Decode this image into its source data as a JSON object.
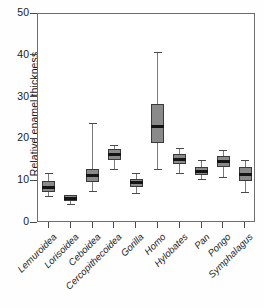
{
  "chart_data": {
    "type": "boxplot",
    "title": "",
    "xlabel": "",
    "ylabel": "Relative enamel thickness",
    "ylim": [
      0,
      50
    ],
    "yticks": [
      0,
      10,
      20,
      30,
      40,
      50
    ],
    "grid": false,
    "legend": "none",
    "categories": [
      "Lemuroidea",
      "Lorisoidea",
      "Ceboidea",
      "Cercopithecoidea",
      "Gorilla",
      "Homo",
      "Hylobates",
      "Pan",
      "Pongo",
      "Symphalagus"
    ],
    "boxes": [
      {
        "name": "Lemuroidea",
        "whisker_low": 6.5,
        "q1": 7.4,
        "median": 8.4,
        "q3": 10.0,
        "whisker_high": 12.0
      },
      {
        "name": "Lorisoidea",
        "whisker_low": 4.5,
        "q1": 5.2,
        "median": 5.9,
        "q3": 6.6,
        "whisker_high": 6.8
      },
      {
        "name": "Ceboidea",
        "whisker_low": 7.7,
        "q1": 9.8,
        "median": 11.3,
        "q3": 13.0,
        "whisker_high": 24.0
      },
      {
        "name": "Cercopithecoidea",
        "whisker_low": 13.0,
        "q1": 15.0,
        "median": 16.4,
        "q3": 17.8,
        "whisker_high": 18.6
      },
      {
        "name": "Gorilla",
        "whisker_low": 7.2,
        "q1": 8.6,
        "median": 9.6,
        "q3": 10.5,
        "whisker_high": 12.0
      },
      {
        "name": "Homo",
        "whisker_low": 13.0,
        "q1": 19.1,
        "median": 23.2,
        "q3": 28.5,
        "whisker_high": 41.0
      },
      {
        "name": "Hylobates",
        "whisker_low": 12.0,
        "q1": 14.0,
        "median": 15.2,
        "q3": 16.5,
        "whisker_high": 18.0
      },
      {
        "name": "Pan",
        "whisker_low": 10.5,
        "q1": 11.5,
        "median": 12.3,
        "q3": 13.5,
        "whisker_high": 15.0
      },
      {
        "name": "Pongo",
        "whisker_low": 11.0,
        "q1": 13.5,
        "median": 14.8,
        "q3": 16.0,
        "whisker_high": 17.5
      },
      {
        "name": "Symphalagus",
        "whisker_low": 7.5,
        "q1": 10.0,
        "median": 11.5,
        "q3": 13.5,
        "whisker_high": 15.0
      }
    ],
    "colors": {
      "box_fill": "#8a8a8a",
      "box_edge": "#3a3a3a",
      "median": "#141414",
      "whisker": "#7a7a7a",
      "axis": "#6e6e6e",
      "background": "#ffffff"
    }
  }
}
